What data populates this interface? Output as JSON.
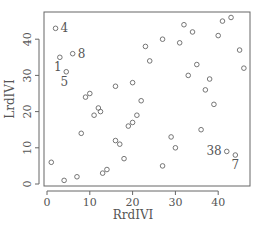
{
  "chart_data": {
    "type": "scatter",
    "title": "",
    "xlabel": "RrdIVI",
    "ylabel": "LrdIVI",
    "xlim": [
      -1,
      47
    ],
    "ylim": [
      -0.5,
      47.5
    ],
    "xticks": [
      0,
      10,
      20,
      30,
      40
    ],
    "yticks": [
      0,
      10,
      20,
      30,
      40
    ],
    "grid": false,
    "legend": null,
    "marker": "open-circle",
    "colors": {
      "marker": "#666666",
      "axis": "#666666",
      "text": "#555555"
    },
    "points": [
      {
        "x": 2,
        "y": 43,
        "label": "4"
      },
      {
        "x": 3,
        "y": 35,
        "label": "1"
      },
      {
        "x": 6,
        "y": 36,
        "label": "8"
      },
      {
        "x": 4.5,
        "y": 31,
        "label": "5"
      },
      {
        "x": 1,
        "y": 6
      },
      {
        "x": 4,
        "y": 1
      },
      {
        "x": 7,
        "y": 2
      },
      {
        "x": 8,
        "y": 14
      },
      {
        "x": 9,
        "y": 24
      },
      {
        "x": 10,
        "y": 25
      },
      {
        "x": 11,
        "y": 19
      },
      {
        "x": 12,
        "y": 21
      },
      {
        "x": 12.5,
        "y": 20
      },
      {
        "x": 13,
        "y": 3
      },
      {
        "x": 14,
        "y": 4
      },
      {
        "x": 16,
        "y": 12
      },
      {
        "x": 17,
        "y": 11
      },
      {
        "x": 18,
        "y": 7
      },
      {
        "x": 16,
        "y": 27
      },
      {
        "x": 19,
        "y": 16
      },
      {
        "x": 20,
        "y": 17
      },
      {
        "x": 21,
        "y": 19
      },
      {
        "x": 22,
        "y": 23
      },
      {
        "x": 20,
        "y": 28
      },
      {
        "x": 23,
        "y": 38
      },
      {
        "x": 24,
        "y": 34
      },
      {
        "x": 27,
        "y": 40
      },
      {
        "x": 27,
        "y": 5
      },
      {
        "x": 29,
        "y": 13
      },
      {
        "x": 30,
        "y": 10
      },
      {
        "x": 31,
        "y": 39
      },
      {
        "x": 32,
        "y": 44
      },
      {
        "x": 33,
        "y": 30
      },
      {
        "x": 34,
        "y": 42
      },
      {
        "x": 35,
        "y": 33
      },
      {
        "x": 36,
        "y": 15
      },
      {
        "x": 37,
        "y": 26
      },
      {
        "x": 38,
        "y": 29
      },
      {
        "x": 39,
        "y": 22
      },
      {
        "x": 40,
        "y": 41
      },
      {
        "x": 41,
        "y": 45
      },
      {
        "x": 43,
        "y": 46
      },
      {
        "x": 42,
        "y": 9,
        "label": "38",
        "label_pos": "left"
      },
      {
        "x": 44,
        "y": 8,
        "label": "7",
        "label_pos": "below"
      },
      {
        "x": 45,
        "y": 37
      },
      {
        "x": 46,
        "y": 32
      }
    ]
  }
}
